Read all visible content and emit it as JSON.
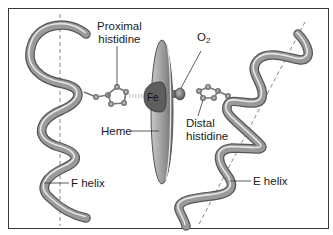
{
  "figure": {
    "labels": {
      "proximal_histidine": [
        "Proximal",
        "histidine"
      ],
      "o2": {
        "base": "O",
        "subscript": "2"
      },
      "fe": "Fe",
      "heme": "Heme",
      "distal_histidine": [
        "Distal",
        "histidine"
      ],
      "f_helix": "F helix",
      "e_helix": "E helix"
    },
    "colors": {
      "helix_fill": "#9a9a9a",
      "helix_outline": "#555555",
      "helix_highlight": "#e6e6e6",
      "heme_disc": "#a8a8a8",
      "fe_patch": "#5e5e5e",
      "frame_border": "#3a3a3a"
    }
  }
}
